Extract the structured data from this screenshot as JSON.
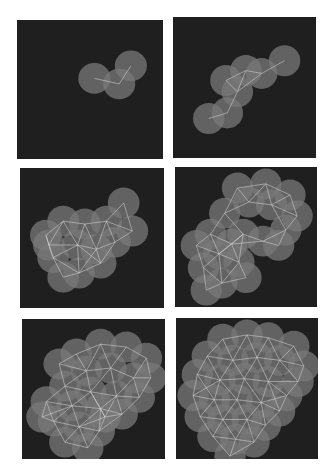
{
  "figure": {
    "colors": {
      "background": "#1f1f1f",
      "disk": "#7a7a7a",
      "disk_opacity": 0.75,
      "edge": "#dcdcdc",
      "page": "#ffffff"
    },
    "panels": [
      {
        "id": "p1",
        "centers": [
          [
            0.53,
            0.42
          ],
          [
            0.7,
            0.46
          ],
          [
            0.78,
            0.33
          ]
        ]
      },
      {
        "id": "p2",
        "centers": [
          [
            0.25,
            0.72
          ],
          [
            0.38,
            0.68
          ],
          [
            0.45,
            0.53
          ],
          [
            0.37,
            0.45
          ],
          [
            0.51,
            0.38
          ],
          [
            0.62,
            0.4
          ],
          [
            0.78,
            0.31
          ]
        ]
      },
      {
        "id": "p3",
        "centers": [
          [
            0.72,
            0.25
          ],
          [
            0.3,
            0.38
          ],
          [
            0.45,
            0.4
          ],
          [
            0.6,
            0.38
          ],
          [
            0.18,
            0.48
          ],
          [
            0.4,
            0.55
          ],
          [
            0.53,
            0.58
          ],
          [
            0.78,
            0.45
          ],
          [
            0.66,
            0.53
          ],
          [
            0.23,
            0.64
          ],
          [
            0.41,
            0.75
          ],
          [
            0.56,
            0.68
          ],
          [
            0.3,
            0.78
          ],
          [
            0.2,
            0.55
          ]
        ]
      },
      {
        "id": "p4",
        "centers": [
          [
            0.44,
            0.15
          ],
          [
            0.64,
            0.12
          ],
          [
            0.81,
            0.2
          ],
          [
            0.86,
            0.35
          ],
          [
            0.35,
            0.33
          ],
          [
            0.52,
            0.25
          ],
          [
            0.68,
            0.27
          ],
          [
            0.78,
            0.45
          ],
          [
            0.48,
            0.48
          ],
          [
            0.62,
            0.53
          ],
          [
            0.73,
            0.56
          ],
          [
            0.25,
            0.48
          ],
          [
            0.15,
            0.56
          ],
          [
            0.31,
            0.62
          ],
          [
            0.45,
            0.68
          ],
          [
            0.2,
            0.72
          ],
          [
            0.33,
            0.83
          ],
          [
            0.5,
            0.79
          ],
          [
            0.22,
            0.88
          ],
          [
            0.4,
            0.55
          ]
        ]
      },
      {
        "id": "p5",
        "centers": [
          [
            0.38,
            0.25
          ],
          [
            0.55,
            0.18
          ],
          [
            0.73,
            0.2
          ],
          [
            0.87,
            0.28
          ],
          [
            0.9,
            0.42
          ],
          [
            0.26,
            0.32
          ],
          [
            0.45,
            0.37
          ],
          [
            0.62,
            0.35
          ],
          [
            0.78,
            0.42
          ],
          [
            0.3,
            0.48
          ],
          [
            0.48,
            0.52
          ],
          [
            0.66,
            0.55
          ],
          [
            0.82,
            0.56
          ],
          [
            0.17,
            0.59
          ],
          [
            0.35,
            0.62
          ],
          [
            0.55,
            0.64
          ],
          [
            0.7,
            0.68
          ],
          [
            0.22,
            0.73
          ],
          [
            0.4,
            0.77
          ],
          [
            0.54,
            0.8
          ],
          [
            0.3,
            0.88
          ],
          [
            0.46,
            0.92
          ],
          [
            0.58,
            0.7
          ],
          [
            0.14,
            0.7
          ]
        ]
      },
      {
        "id": "p6",
        "centers": [
          [
            0.33,
            0.15
          ],
          [
            0.5,
            0.12
          ],
          [
            0.65,
            0.14
          ],
          [
            0.83,
            0.2
          ],
          [
            0.9,
            0.34
          ],
          [
            0.22,
            0.27
          ],
          [
            0.4,
            0.3
          ],
          [
            0.57,
            0.28
          ],
          [
            0.73,
            0.3
          ],
          [
            0.86,
            0.45
          ],
          [
            0.15,
            0.4
          ],
          [
            0.31,
            0.44
          ],
          [
            0.48,
            0.43
          ],
          [
            0.65,
            0.45
          ],
          [
            0.78,
            0.55
          ],
          [
            0.12,
            0.55
          ],
          [
            0.27,
            0.58
          ],
          [
            0.43,
            0.58
          ],
          [
            0.6,
            0.6
          ],
          [
            0.73,
            0.66
          ],
          [
            0.17,
            0.7
          ],
          [
            0.33,
            0.72
          ],
          [
            0.5,
            0.72
          ],
          [
            0.63,
            0.76
          ],
          [
            0.26,
            0.84
          ],
          [
            0.42,
            0.86
          ],
          [
            0.55,
            0.88
          ],
          [
            0.38,
            0.98
          ]
        ]
      }
    ]
  }
}
